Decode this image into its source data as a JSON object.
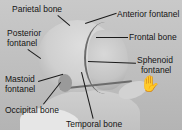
{
  "figure": {
    "labels": {
      "parietal_bone": "Parietal bone",
      "anterior_fontanel": "Anterior fontanel",
      "posterior_fontanel_line1": "Posterior",
      "posterior_fontanel_line2": "fontanel",
      "frontal_bone": "Frontal bone",
      "sphenoid_fontanel_line1": "Sphenoid",
      "sphenoid_fontanel_line2": "fontanel",
      "mastoid_fontanel_line1": "Mastoid",
      "mastoid_fontanel_line2": "fontanel",
      "occipital_bone": "Occipital bone",
      "temporal_bone": "Temporal bone"
    },
    "colors": {
      "background": "#c4c4c4",
      "text": "#141414",
      "leader_line": "#1a1a1a"
    }
  }
}
